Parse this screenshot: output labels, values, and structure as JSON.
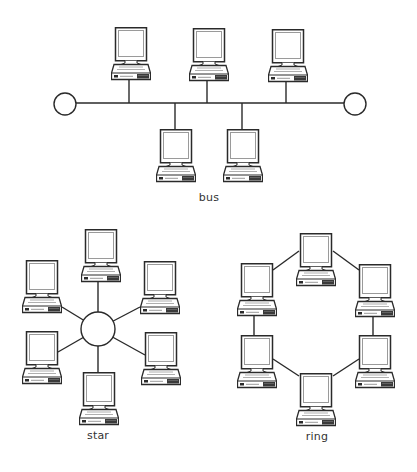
{
  "colors": {
    "line": "#2a2a2a",
    "screen_border": "#9a9a9a",
    "background": "#ffffff",
    "base_dark": "#3a3a3a"
  },
  "icons": {
    "computer": "computer-icon",
    "terminator": "terminator-circle",
    "hub": "hub-circle"
  },
  "bus": {
    "label": "bus",
    "label_pos": {
      "x": 209,
      "y": 191
    },
    "backbone": {
      "x1": 76,
      "x2": 344,
      "y": 103
    },
    "terminators": [
      {
        "cx": 65,
        "cy": 104,
        "r": 11
      },
      {
        "cx": 355,
        "cy": 104,
        "r": 11
      }
    ],
    "computers": [
      {
        "x": 111,
        "y": 27,
        "drop_x": 129,
        "side": "top"
      },
      {
        "x": 189,
        "y": 28,
        "drop_x": 207,
        "side": "top"
      },
      {
        "x": 268,
        "y": 29,
        "drop_x": 286,
        "side": "top"
      },
      {
        "x": 156,
        "y": 129,
        "drop_x": 175,
        "side": "bottom"
      },
      {
        "x": 223,
        "y": 129,
        "drop_x": 242,
        "side": "bottom"
      }
    ]
  },
  "star": {
    "label": "star",
    "label_pos": {
      "x": 98,
      "y": 429
    },
    "hub": {
      "cx": 98,
      "cy": 329,
      "r": 17
    },
    "computers": [
      {
        "x": 81,
        "y": 229,
        "link": [
          98,
          280
        ]
      },
      {
        "x": 22,
        "y": 260,
        "link": [
          62,
          307
        ]
      },
      {
        "x": 140,
        "y": 261,
        "link": [
          140,
          307
        ]
      },
      {
        "x": 22,
        "y": 331,
        "link": [
          58,
          352
        ]
      },
      {
        "x": 141,
        "y": 332,
        "link": [
          145,
          355
        ]
      },
      {
        "x": 79,
        "y": 372,
        "link": [
          98,
          372
        ]
      }
    ]
  },
  "ring": {
    "label": "ring",
    "label_pos": {
      "x": 317,
      "y": 430
    },
    "computers": [
      {
        "x": 296,
        "y": 233
      },
      {
        "x": 237,
        "y": 263
      },
      {
        "x": 355,
        "y": 264
      },
      {
        "x": 237,
        "y": 335
      },
      {
        "x": 355,
        "y": 335
      },
      {
        "x": 296,
        "y": 373
      }
    ],
    "links": [
      [
        299,
        251,
        273,
        270
      ],
      [
        333,
        251,
        359,
        270
      ],
      [
        254,
        313,
        254,
        335
      ],
      [
        373,
        314,
        373,
        335
      ],
      [
        273,
        359,
        299,
        376
      ],
      [
        359,
        359,
        333,
        376
      ]
    ]
  }
}
